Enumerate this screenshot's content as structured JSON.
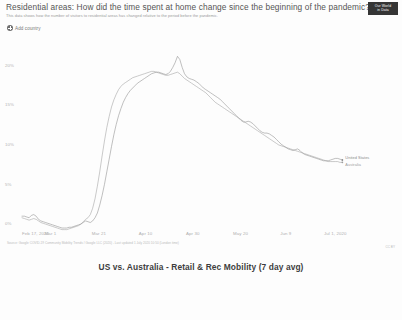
{
  "header": {
    "title": "Residential areas: How did the time spent at home change since the beginning of the pandemic?",
    "subtitle": "This data shows how the number of visitors to residential areas has changed relative to the period before the pandemic.",
    "logo_line1": "Our World",
    "logo_line2": "in Data"
  },
  "controls": {
    "add_country_label": "Add country",
    "add_country_icon": "plus-circle-icon"
  },
  "footer": {
    "source": "Source: Google COVID-19 Community Mobility Trends / Google LLC (2020) - Last updated 1 July 2020 10:50 (London time)",
    "note": "Note: Visits to residential places are not comparable to the other categories because they measure a different kind of change.",
    "license": "CC BY"
  },
  "caption": "US vs. Australia - Retail & Rec Mobility (7 day avg)",
  "chart_data": {
    "type": "line",
    "title": "Residential areas: How did the time spent at home change since the beginning of the pandemic?",
    "xlabel": "",
    "ylabel": "",
    "grid": false,
    "legend_position": "right-inline",
    "ylim": [
      -1,
      22
    ],
    "ytick_labels": [
      "20%",
      "15%",
      "10%",
      "5%",
      "0%"
    ],
    "ytick_values": [
      20,
      15,
      10,
      5,
      0
    ],
    "xtick_labels": [
      "Feb 17, 2020",
      "Mar 1",
      "Mar 21",
      "Apr 10",
      "Apr 30",
      "May 20",
      "Jun 9",
      "Jul 1, 2020"
    ],
    "xtick_positions": [
      0,
      13,
      33,
      53,
      73,
      93,
      113,
      135
    ],
    "x_days_total": 135,
    "series": [
      {
        "name": "United States",
        "color": "#8b8b8b",
        "values": [
          1.0,
          1.0,
          0.9,
          0.8,
          1.1,
          1.2,
          1.0,
          0.6,
          0.4,
          0.3,
          0.2,
          0.1,
          0.0,
          -0.1,
          -0.2,
          -0.3,
          -0.4,
          -0.5,
          -0.5,
          -0.5,
          -0.4,
          -0.4,
          -0.3,
          -0.2,
          -0.1,
          0.0,
          0.2,
          0.4,
          0.3,
          0.2,
          0.4,
          0.8,
          1.4,
          2.4,
          3.6,
          5.0,
          6.6,
          8.2,
          9.8,
          11.3,
          12.6,
          13.7,
          14.6,
          15.4,
          16.0,
          16.5,
          16.9,
          17.2,
          17.5,
          17.8,
          18.0,
          18.2,
          18.4,
          18.6,
          18.8,
          19.0,
          19.1,
          19.2,
          19.2,
          19.1,
          19.0,
          18.9,
          19.0,
          19.3,
          19.8,
          20.4,
          21.2,
          20.8,
          19.8,
          19.0,
          18.6,
          18.4,
          18.3,
          18.2,
          18.0,
          17.8,
          17.5,
          17.2,
          17.0,
          16.8,
          16.6,
          16.4,
          16.2,
          16.0,
          15.8,
          15.5,
          15.2,
          14.9,
          14.6,
          14.3,
          14.0,
          13.7,
          13.4,
          13.1,
          12.9,
          12.9,
          13.0,
          12.9,
          12.7,
          12.4,
          12.1,
          11.8,
          11.6,
          11.5,
          11.5,
          11.4,
          11.2,
          11.0,
          10.7,
          10.4,
          10.1,
          9.9,
          9.7,
          9.5,
          9.4,
          9.3,
          9.4,
          9.5,
          9.3,
          9.0,
          8.8,
          8.7,
          8.6,
          8.5,
          8.4,
          8.3,
          8.2,
          8.1,
          8.0,
          8.0,
          8.0,
          8.1,
          8.2,
          8.3,
          8.3,
          8.2,
          8.1
        ]
      },
      {
        "name": "Australia",
        "color": "#9d9d9d",
        "values": [
          0.8,
          0.7,
          0.6,
          0.5,
          0.6,
          0.7,
          0.6,
          0.4,
          0.2,
          0.1,
          0.0,
          -0.1,
          -0.2,
          -0.3,
          -0.4,
          -0.5,
          -0.6,
          -0.7,
          -0.7,
          -0.7,
          -0.6,
          -0.5,
          -0.4,
          -0.3,
          -0.2,
          0.0,
          0.3,
          0.6,
          0.8,
          1.2,
          2.0,
          3.2,
          4.8,
          6.6,
          8.6,
          10.5,
          12.2,
          13.6,
          14.8,
          15.7,
          16.4,
          17.0,
          17.4,
          17.7,
          17.9,
          18.1,
          18.3,
          18.5,
          18.6,
          18.7,
          18.8,
          18.9,
          19.0,
          19.1,
          19.2,
          19.3,
          19.3,
          19.2,
          19.1,
          19.0,
          18.9,
          18.8,
          18.8,
          18.9,
          19.0,
          19.1,
          19.2,
          19.0,
          18.7,
          18.4,
          18.2,
          18.0,
          17.8,
          17.6,
          17.4,
          17.2,
          17.0,
          16.8,
          16.6,
          16.3,
          16.0,
          15.7,
          15.4,
          15.2,
          15.0,
          14.8,
          14.6,
          14.4,
          14.2,
          14.0,
          13.8,
          13.6,
          13.4,
          13.2,
          13.0,
          12.8,
          12.6,
          12.4,
          12.2,
          12.0,
          11.8,
          11.6,
          11.4,
          11.2,
          11.0,
          10.8,
          10.6,
          10.4,
          10.2,
          10.0,
          9.9,
          9.8,
          9.7,
          9.6,
          9.5,
          9.4,
          9.3,
          9.2,
          9.1,
          9.0,
          8.9,
          8.8,
          8.7,
          8.6,
          8.5,
          8.4,
          8.3,
          8.2,
          8.1,
          8.0,
          7.9,
          7.9,
          7.9,
          7.9,
          7.9,
          7.8,
          7.8
        ]
      }
    ]
  }
}
